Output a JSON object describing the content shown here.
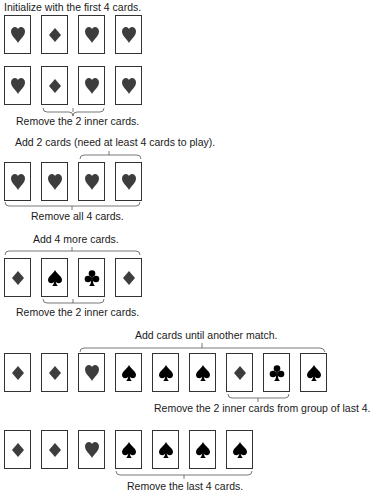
{
  "steps": [
    {
      "caption": "Initialize with the first 4 cards.",
      "cards": [
        "heart",
        "diamond",
        "heart",
        "heart"
      ]
    },
    {
      "cards": [
        "heart",
        "diamond",
        "heart",
        "heart"
      ],
      "caption_below": "Remove the 2 inner cards."
    },
    {
      "caption": "Add 2 cards (need at least 4 cards to play).",
      "cards": [
        "heart",
        "heart",
        "heart",
        "heart"
      ],
      "caption_below": "Remove all 4 cards."
    },
    {
      "caption": "Add 4 more cards.",
      "cards": [
        "diamond",
        "spade",
        "club",
        "diamond"
      ],
      "caption_below": "Remove the 2 inner cards."
    },
    {
      "caption": "Add cards until another match.",
      "cards": [
        "diamond",
        "diamond",
        "heart",
        "spade",
        "spade",
        "spade",
        "diamond",
        "club",
        "spade"
      ],
      "caption_below": "Remove the 2 inner cards from group of last 4."
    },
    {
      "cards": [
        "diamond",
        "diamond",
        "heart",
        "spade",
        "spade",
        "spade",
        "spade"
      ],
      "caption_below": "Remove the last 4 cards."
    }
  ],
  "colors": {
    "red_suit": "#3d3d3d",
    "black_suit": "#000000",
    "card_border": "#333333"
  }
}
